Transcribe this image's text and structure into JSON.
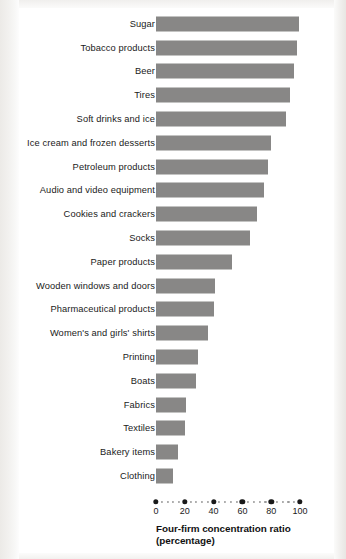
{
  "chart_data": {
    "type": "bar",
    "orientation": "horizontal",
    "title": "",
    "xlabel": "Four-firm concentration ratio (percentage)",
    "ylabel": "",
    "xlim": [
      0,
      100
    ],
    "grid": false,
    "legend": null,
    "bar_color": "#888786",
    "categories": [
      "Sugar",
      "Tobacco  products",
      "Beer",
      "Tires",
      "Soft drinks and ice",
      "Ice cream and frozen desserts",
      "Petroleum products",
      "Audio and video equipment",
      "Cookies and crackers",
      "Socks",
      "Paper products",
      "Wooden windows and doors",
      "Pharmaceutical products",
      "Women's and girls' shirts",
      "Printing",
      "Boats",
      "Fabrics",
      "Textiles",
      "Bakery items",
      "Clothing"
    ],
    "values": [
      99,
      98,
      96,
      93,
      90,
      80,
      78,
      75,
      70,
      65,
      53,
      41,
      40,
      36,
      29,
      28,
      21,
      20,
      15,
      12
    ],
    "xticks": [
      0,
      20,
      40,
      60,
      80,
      100
    ],
    "xtick_labels": [
      "0",
      "20",
      "40",
      "60",
      "80",
      "100"
    ]
  },
  "axis": {
    "title_line1": "Four-firm concentration ratio",
    "title_line2": "(percentage)"
  }
}
